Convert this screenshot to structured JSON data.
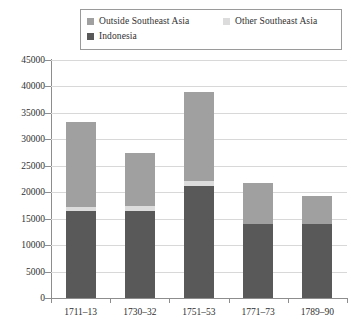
{
  "legend": {
    "entries": [
      {
        "label": "Outside Southeast Asia",
        "color": "#a0a0a0",
        "swatch_name": "legend-swatch-outside-southeast-asia"
      },
      {
        "label": "Other Southeast Asia",
        "color": "#dcdcdc",
        "swatch_name": "legend-swatch-other-southeast-asia"
      },
      {
        "label": "Indonesia",
        "color": "#595959",
        "swatch_name": "legend-swatch-indonesia"
      }
    ]
  },
  "axes": {
    "y_ticks": [
      "45000",
      "40000",
      "35000",
      "30000",
      "25000",
      "20000",
      "15000",
      "10000",
      "5000",
      "0"
    ],
    "x_ticks": [
      "1711–13",
      "1730–32",
      "1751–53",
      "1771–73",
      "1789–90"
    ]
  },
  "chart_data": {
    "type": "bar",
    "subtype": "stacked",
    "title": "",
    "subtitle": "",
    "xlabel": "",
    "ylabel": "",
    "ylim": [
      0,
      45000
    ],
    "ytick_step": 5000,
    "grid": true,
    "legend_position": "top",
    "categories": [
      "1711–13",
      "1730–32",
      "1751–53",
      "1771–73",
      "1789–90"
    ],
    "series": [
      {
        "name": "Indonesia",
        "color": "#595959",
        "values": [
          16500,
          16500,
          21200,
          14000,
          14000
        ]
      },
      {
        "name": "Other Southeast Asia",
        "color": "#dcdcdc",
        "values": [
          800,
          900,
          900,
          0,
          0
        ]
      },
      {
        "name": "Outside Southeast Asia",
        "color": "#a0a0a0",
        "values": [
          16000,
          10100,
          16900,
          7800,
          5300
        ]
      }
    ],
    "totals": [
      33300,
      27500,
      39000,
      21800,
      19300
    ]
  }
}
